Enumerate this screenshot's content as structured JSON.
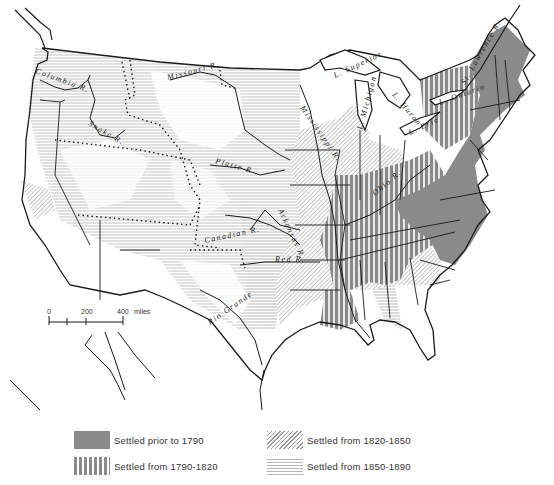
{
  "map": {
    "title": "",
    "colors": {
      "prior_1790": "#8a8a8a",
      "from_1790_1820": "#8a8a8a",
      "from_1820_1850": "#9a9a9a",
      "from_1850_1890": "#b5b5b5",
      "outline": "#1a1a1a"
    },
    "labels": {
      "columbia": "Columbia R.",
      "snake": "Snake R.",
      "missouri": "Missouri R.",
      "platte": "Platte R.",
      "arkansas": "Arkansas R.",
      "canadian": "Canadian R.",
      "red": "Red R.",
      "rio_grande": "Rio Grande",
      "mississippi": "Mississippi R.",
      "ohio": "Ohio R.",
      "l_superior": "L. Superior",
      "l_michigan": "L. Michigan",
      "l_huron": "L. Huron",
      "l_erie": "L. Erie",
      "l_ontario": "L. Ontario",
      "st_lawrence": "St. Lawrence R."
    },
    "scale": {
      "ticks": [
        "0",
        "200",
        "400"
      ],
      "unit": "miles"
    }
  },
  "legend": {
    "items": [
      {
        "label": "Settled prior to 1790",
        "pattern": "solid"
      },
      {
        "label": "Settled from 1790-1820",
        "pattern": "vertical-lines"
      },
      {
        "label": "Settled from 1820-1850",
        "pattern": "diagonal-lines"
      },
      {
        "label": "Settled from 1850-1890",
        "pattern": "horizontal-lines"
      }
    ]
  }
}
